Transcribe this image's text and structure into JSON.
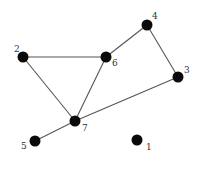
{
  "diagram": {
    "type": "undirected-graph",
    "node_radius": 5.5,
    "colors": {
      "node": "#0a0a0a",
      "edge": "#555555",
      "label": "#333333",
      "background": "#ffffff"
    },
    "nodes": [
      {
        "id": "1",
        "label": "1",
        "x": 137,
        "y": 140,
        "label_dx": 9,
        "label_dy": 10
      },
      {
        "id": "2",
        "label": "2",
        "x": 23,
        "y": 57,
        "label_dx": -9,
        "label_dy": -5
      },
      {
        "id": "3",
        "label": "3",
        "x": 178,
        "y": 77,
        "label_dx": 6,
        "label_dy": -4
      },
      {
        "id": "4",
        "label": "4",
        "x": 147,
        "y": 25,
        "label_dx": 5,
        "label_dy": -6
      },
      {
        "id": "5",
        "label": "5",
        "x": 35,
        "y": 141,
        "label_dx": -14,
        "label_dy": 8
      },
      {
        "id": "6",
        "label": "6",
        "x": 106,
        "y": 57,
        "label_dx": 6,
        "label_dy": 9
      },
      {
        "id": "7",
        "label": "7",
        "x": 75,
        "y": 121,
        "label_dx": 7,
        "label_dy": 10
      }
    ],
    "edges": [
      {
        "from": "2",
        "to": "6"
      },
      {
        "from": "2",
        "to": "7"
      },
      {
        "from": "6",
        "to": "7"
      },
      {
        "from": "6",
        "to": "4"
      },
      {
        "from": "4",
        "to": "3"
      },
      {
        "from": "3",
        "to": "7"
      },
      {
        "from": "7",
        "to": "5"
      }
    ]
  }
}
